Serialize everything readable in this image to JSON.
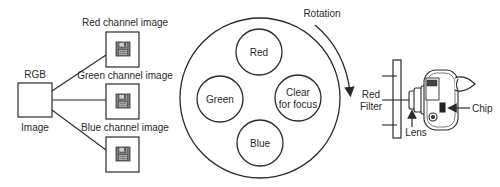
{
  "source": {
    "label_top": "RGB",
    "label_bottom": "Image"
  },
  "channels": [
    {
      "label": "Red channel image",
      "icon": "floppy-disk-icon"
    },
    {
      "label": "Green channel image",
      "icon": "floppy-disk-icon"
    },
    {
      "label": "Blue channel image",
      "icon": "floppy-disk-icon"
    }
  ],
  "filter_wheel": {
    "rotation_label": "Rotation",
    "filters": [
      {
        "name": "red",
        "label": "Red"
      },
      {
        "name": "green",
        "label": "Green"
      },
      {
        "name": "clear",
        "label_line1": "Clear",
        "label_line2": "for focus"
      },
      {
        "name": "blue",
        "label": "Blue"
      }
    ]
  },
  "camera": {
    "filter_label_line1": "Red",
    "filter_label_line2": "Filter",
    "lens_label": "Lens",
    "chip_label": "Chip"
  },
  "colors": {
    "stroke": "#2a2a2a",
    "icon_fill": "#8a8a8a"
  }
}
